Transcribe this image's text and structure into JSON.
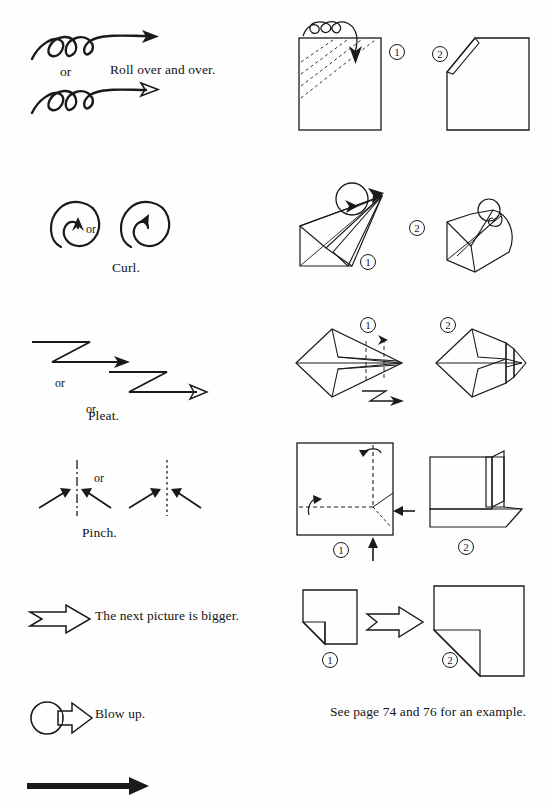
{
  "page": {
    "kind": "origami-symbol-reference-page",
    "background_color": "#fefefe",
    "ink_color": "#1a1a1a",
    "shade_color": "#c9c9c9"
  },
  "rows": [
    {
      "id": "roll-over",
      "symbol_name": "spiral-roll-arrow",
      "or_label": "or",
      "caption": "Roll over and over.",
      "steps": [
        {
          "number": "①",
          "desc": "square-with-dashed-diagonals-and-roll-arrow"
        },
        {
          "number": "②",
          "desc": "square-with-rolled-corner"
        }
      ]
    },
    {
      "id": "curl",
      "symbol_name": "curl-loop-arrow",
      "or_label": "or",
      "caption": "Curl.",
      "steps": [
        {
          "number": "①",
          "desc": "pointed-model-with-curl-loop-at-tip"
        },
        {
          "number": "②",
          "desc": "model-with-curled-tip"
        }
      ]
    },
    {
      "id": "pleat",
      "symbol_name": "zigzag-pleat-arrow",
      "or_label": "or",
      "caption": "Pleat.",
      "steps": [
        {
          "number": "①",
          "desc": "kite-model-with-pleat-crease-lines"
        },
        {
          "number": "②",
          "desc": "kite-model-pleated"
        }
      ]
    },
    {
      "id": "pinch",
      "symbol_name": "pinch-arrows-at-crease",
      "or_label": "or",
      "caption": "Pinch.",
      "steps": [
        {
          "number": "①",
          "desc": "square-with-dashed-creases-and-push-arrows"
        },
        {
          "number": "②",
          "desc": "pinched-result-with-shaded-flaps"
        }
      ]
    },
    {
      "id": "bigger",
      "symbol_name": "hollow-arrow",
      "or_label": "",
      "caption": "The next picture is bigger.",
      "steps": [
        {
          "number": "①",
          "desc": "small-square-with-shaded-corner"
        },
        {
          "number": "②",
          "desc": "enlarged-square-with-shaded-corner"
        }
      ]
    },
    {
      "id": "blow-up",
      "symbol_name": "circle-hollow-arrow",
      "or_label": "",
      "caption": "Blow up.",
      "steps": []
    }
  ],
  "note": "See page 74 and 76 for an example.",
  "footer_rule": {
    "name": "thick-solid-arrow",
    "description": "solid arrow rule at bottom of page"
  },
  "symbols": {
    "step_one": "①",
    "step_two": "②"
  }
}
